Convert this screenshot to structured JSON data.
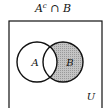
{
  "title": {
    "set_a": "A",
    "complement": "c",
    "op": "∩",
    "set_b": "B"
  },
  "labels": {
    "a": "A",
    "b": "B",
    "universe": "U"
  },
  "colors": {
    "shade": "#b8b8b8",
    "stroke": "#111111",
    "background": "#ffffff"
  },
  "shaded_region": "B minus A"
}
